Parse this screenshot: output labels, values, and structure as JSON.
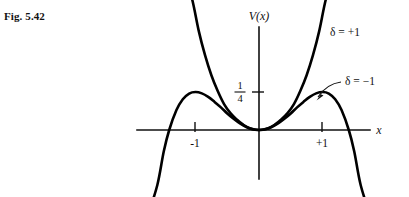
{
  "figure": {
    "label": "Fig. 5.42",
    "background_color": "#ffffff",
    "ink_color": "#000000"
  },
  "axes": {
    "y_axis_title": "V(x)",
    "x_axis_title": "x",
    "y_tick_label_numerator": "1",
    "y_tick_label_denominator": "4",
    "x_tick_labels": [
      "-1",
      "+1"
    ]
  },
  "annotations": {
    "curve_label_positive": "δ = +1",
    "curve_label_negative": "δ = −1"
  },
  "chart_data": {
    "type": "line",
    "title": "Fig. 5.42",
    "xlabel": "x",
    "ylabel": "V(x)",
    "xlim": [
      -1.92,
      1.92
    ],
    "ylim": [
      -0.62,
      0.84
    ],
    "grid": false,
    "legend": "inline-curve-labels",
    "annotations": [
      {
        "text": "δ = +1",
        "attaches_to": "series-delta-plus-1",
        "leader": "none",
        "x": 1.52,
        "y": 0.7
      },
      {
        "text": "δ = −1",
        "attaches_to": "series-delta-minus-1",
        "leader": "curved-arrow",
        "x": 1.6,
        "y": 0.34,
        "arrow_tip_x": 1.02,
        "arrow_tip_y": 0.26
      }
    ],
    "x_ticks": [
      -1,
      1
    ],
    "x_tick_labels": [
      "-1",
      "+1"
    ],
    "y_ticks": [
      0.25
    ],
    "y_tick_labels": [
      "1/4"
    ],
    "series": [
      {
        "name": "δ = +1",
        "formula": "V(x) = (1/2)x^2 + (1/4)x^4",
        "x": [
          -1.18,
          -1.05,
          -0.95,
          -0.85,
          -0.75,
          -0.65,
          -0.55,
          -0.45,
          -0.35,
          -0.25,
          -0.15,
          0.0,
          0.15,
          0.25,
          0.35,
          0.45,
          0.55,
          0.65,
          0.75,
          0.85,
          0.95,
          1.05,
          1.18
        ],
        "values": [
          1.044,
          0.855,
          0.654,
          0.492,
          0.36,
          0.256,
          0.17,
          0.111,
          0.069,
          0.035,
          0.012,
          0.0,
          0.012,
          0.035,
          0.069,
          0.111,
          0.17,
          0.256,
          0.36,
          0.492,
          0.654,
          0.855,
          1.044
        ]
      },
      {
        "name": "δ = −1",
        "formula": "V(x) = (1/2)x^2 − (1/4)x^4",
        "x": [
          -1.75,
          -1.6,
          -1.5,
          -1.414,
          -1.3,
          -1.2,
          -1.1,
          -1.0,
          -0.9,
          -0.8,
          -0.7,
          -0.6,
          -0.5,
          -0.4,
          -0.3,
          -0.2,
          -0.1,
          0.0,
          0.1,
          0.2,
          0.3,
          0.4,
          0.5,
          0.6,
          0.7,
          0.8,
          0.9,
          1.0,
          1.1,
          1.2,
          1.3,
          1.414,
          1.5,
          1.6,
          1.75
        ],
        "values": [
          -0.563,
          -0.36,
          -0.141,
          0.0,
          0.131,
          0.202,
          0.24,
          0.25,
          0.241,
          0.218,
          0.185,
          0.149,
          0.109,
          0.074,
          0.043,
          0.02,
          0.005,
          0.0,
          0.005,
          0.02,
          0.043,
          0.074,
          0.109,
          0.149,
          0.185,
          0.218,
          0.241,
          0.25,
          0.24,
          0.202,
          0.131,
          0.0,
          -0.141,
          -0.36,
          -0.563
        ]
      }
    ]
  }
}
